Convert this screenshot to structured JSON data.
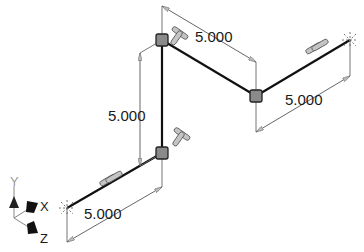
{
  "drawing": {
    "type": "isometric 3D sketch",
    "dimensions": [
      {
        "id": "dim-bottom-left",
        "label": "5.000"
      },
      {
        "id": "dim-vertical",
        "label": "5.000"
      },
      {
        "id": "dim-top-diagonal",
        "label": "5.000"
      },
      {
        "id": "dim-right",
        "label": "5.000"
      }
    ],
    "constraints": [
      "parallel",
      "perpendicular",
      "perpendicular",
      "parallel"
    ],
    "triad": {
      "x_label": "X",
      "y_label": "Y",
      "z_label": "Z"
    }
  },
  "colors": {
    "line": "#111111",
    "dimension": "#555555",
    "vertex_fill": "#8a8a8a",
    "constraint_glyph": "#b8b8b8"
  }
}
